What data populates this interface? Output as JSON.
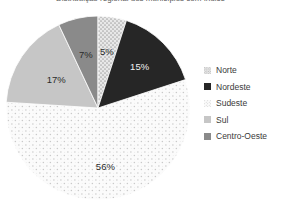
{
  "title": {
    "text": "Distribuição regional dos municípios com índice",
    "cropped": true
  },
  "legend": {
    "position": "right",
    "items": [
      {
        "label": "Norte",
        "swatch": "pattern-dots-medium",
        "color": "#d9d9d9"
      },
      {
        "label": "Nordeste",
        "swatch": "solid",
        "color": "#262626"
      },
      {
        "label": "Sudeste",
        "swatch": "pattern-dots-sparse",
        "color": "#f7f7f7"
      },
      {
        "label": "Sul",
        "swatch": "solid",
        "color": "#c6c6c6"
      },
      {
        "label": "Centro-Oeste",
        "swatch": "solid",
        "color": "#8a8a8a"
      }
    ]
  },
  "chart_data": {
    "type": "pie",
    "title": "Distribuição regional dos municípios com índice",
    "xlabel": "",
    "ylabel": "",
    "legend_position": "right",
    "grid": false,
    "start_angle_deg": 0,
    "direction": "clockwise",
    "categories": [
      "Norte",
      "Nordeste",
      "Sudeste",
      "Sul",
      "Centro-Oeste"
    ],
    "values": [
      5,
      15,
      56,
      17,
      7
    ],
    "unit": "%",
    "data_labels": [
      "5%",
      "15%",
      "56%",
      "17%",
      "7%"
    ],
    "slice_styles": [
      {
        "name": "Norte",
        "fill": "#d9d9d9",
        "pattern": "dots-medium",
        "label_color": "#2b2b2b"
      },
      {
        "name": "Nordeste",
        "fill": "#262626",
        "pattern": "none",
        "label_color": "#f2f2f2"
      },
      {
        "name": "Sudeste",
        "fill": "#f7f7f7",
        "pattern": "dots-sparse",
        "label_color": "#2b2b2b"
      },
      {
        "name": "Sul",
        "fill": "#c6c6c6",
        "pattern": "none",
        "label_color": "#2b2b2b"
      },
      {
        "name": "Centro-Oeste",
        "fill": "#8a8a8a",
        "pattern": "none",
        "label_color": "#2b2b2b"
      }
    ]
  }
}
